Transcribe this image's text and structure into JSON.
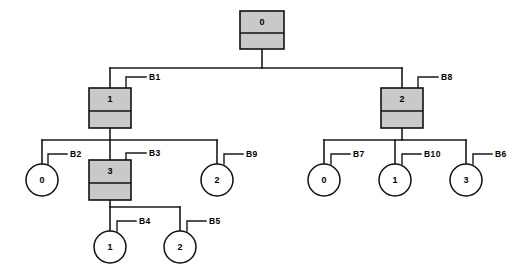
{
  "diagram": {
    "type": "tree-diagram",
    "background_color": "#ffffff",
    "line_color": "#1a1a1a",
    "box_fill_color": "#c9c9c9",
    "circle_fill_color": "#ffffff"
  },
  "nodes": [
    {
      "id": "n0",
      "value": "0",
      "shape": "box",
      "x": 262,
      "y": 30,
      "w": 44,
      "h": 38,
      "split": 22
    },
    {
      "id": "n1",
      "value": "1",
      "shape": "box",
      "x": 110,
      "y": 108,
      "w": 42,
      "h": 40,
      "split": 23
    },
    {
      "id": "n2",
      "value": "2",
      "shape": "box",
      "x": 402,
      "y": 108,
      "w": 42,
      "h": 40,
      "split": 23
    },
    {
      "id": "n3",
      "value": "0",
      "shape": "circle",
      "x": 42,
      "y": 180,
      "r": 16
    },
    {
      "id": "n4",
      "value": "3",
      "shape": "box",
      "x": 110,
      "y": 180,
      "w": 42,
      "h": 40,
      "split": 23
    },
    {
      "id": "n5",
      "value": "2",
      "shape": "circle",
      "x": 217,
      "y": 180,
      "r": 16
    },
    {
      "id": "n6",
      "value": "0",
      "shape": "circle",
      "x": 324,
      "y": 180,
      "r": 16
    },
    {
      "id": "n7",
      "value": "1",
      "shape": "circle",
      "x": 395,
      "y": 180,
      "r": 16
    },
    {
      "id": "n8",
      "value": "3",
      "shape": "circle",
      "x": 466,
      "y": 180,
      "r": 16
    },
    {
      "id": "n9",
      "value": "1",
      "shape": "circle",
      "x": 110,
      "y": 247,
      "r": 16
    },
    {
      "id": "n10",
      "value": "2",
      "shape": "circle",
      "x": 180,
      "y": 247,
      "r": 16
    }
  ],
  "edges": [
    {
      "from": "n0",
      "to": "n1",
      "bus_y": 68
    },
    {
      "from": "n0",
      "to": "n2",
      "bus_y": 68
    },
    {
      "from": "n1",
      "to": "n3",
      "bus_y": 140
    },
    {
      "from": "n1",
      "to": "n4",
      "bus_y": 140
    },
    {
      "from": "n1",
      "to": "n5",
      "bus_y": 140
    },
    {
      "from": "n2",
      "to": "n6",
      "bus_y": 140
    },
    {
      "from": "n2",
      "to": "n7",
      "bus_y": 140
    },
    {
      "from": "n2",
      "to": "n8",
      "bus_y": 140
    },
    {
      "from": "n4",
      "to": "n9",
      "bus_y": 207
    },
    {
      "from": "n4",
      "to": "n10",
      "bus_y": 207
    }
  ],
  "branch_labels": [
    {
      "id": "B1",
      "text": "B1",
      "node": "n1",
      "anchor_x": 126,
      "anchor_y": 88,
      "elbow_y": 77,
      "text_x": 149
    },
    {
      "id": "B8",
      "text": "B8",
      "node": "n2",
      "anchor_x": 418,
      "anchor_y": 88,
      "elbow_y": 77,
      "text_x": 441
    },
    {
      "id": "B2",
      "text": "B2",
      "node": "n3",
      "anchor_x": 48,
      "anchor_y": 164,
      "elbow_y": 154,
      "text_x": 70
    },
    {
      "id": "B3",
      "text": "B3",
      "node": "n4",
      "anchor_x": 126,
      "anchor_y": 160,
      "elbow_y": 153,
      "text_x": 149
    },
    {
      "id": "B9",
      "text": "B9",
      "node": "n5",
      "anchor_x": 224,
      "anchor_y": 164,
      "elbow_y": 154,
      "text_x": 246
    },
    {
      "id": "B7",
      "text": "B7",
      "node": "n6",
      "anchor_x": 331,
      "anchor_y": 164,
      "elbow_y": 154,
      "text_x": 353
    },
    {
      "id": "B10",
      "text": "B10",
      "node": "n7",
      "anchor_x": 402,
      "anchor_y": 164,
      "elbow_y": 154,
      "text_x": 424
    },
    {
      "id": "B6",
      "text": "B6",
      "node": "n8",
      "anchor_x": 473,
      "anchor_y": 164,
      "elbow_y": 154,
      "text_x": 495
    },
    {
      "id": "B4",
      "text": "B4",
      "node": "n9",
      "anchor_x": 117,
      "anchor_y": 231,
      "elbow_y": 221,
      "text_x": 139
    },
    {
      "id": "B5",
      "text": "B5",
      "node": "n10",
      "anchor_x": 187,
      "anchor_y": 231,
      "elbow_y": 221,
      "text_x": 209
    }
  ],
  "chart_data": {
    "type": "tree",
    "root": "0",
    "structure": [
      {
        "node": "0",
        "shape": "box",
        "children": [
          "1",
          "2"
        ],
        "branch": null
      },
      {
        "node": "1",
        "shape": "box",
        "children": [
          "0",
          "3",
          "2"
        ],
        "branch": "B1"
      },
      {
        "node": "2",
        "shape": "box",
        "children": [
          "0",
          "1",
          "3"
        ],
        "branch": "B8"
      },
      {
        "node": "0",
        "shape": "circle",
        "children": [],
        "branch": "B2"
      },
      {
        "node": "3",
        "shape": "box",
        "children": [
          "1",
          "2"
        ],
        "branch": "B3"
      },
      {
        "node": "2",
        "shape": "circle",
        "children": [],
        "branch": "B9"
      },
      {
        "node": "0",
        "shape": "circle",
        "children": [],
        "branch": "B7"
      },
      {
        "node": "1",
        "shape": "circle",
        "children": [],
        "branch": "B10"
      },
      {
        "node": "3",
        "shape": "circle",
        "children": [],
        "branch": "B6"
      },
      {
        "node": "1",
        "shape": "circle",
        "children": [],
        "branch": "B4"
      },
      {
        "node": "2",
        "shape": "circle",
        "children": [],
        "branch": "B5"
      }
    ],
    "branch_names": [
      "B1",
      "B2",
      "B3",
      "B4",
      "B5",
      "B6",
      "B7",
      "B8",
      "B9",
      "B10"
    ],
    "levels": 4
  }
}
